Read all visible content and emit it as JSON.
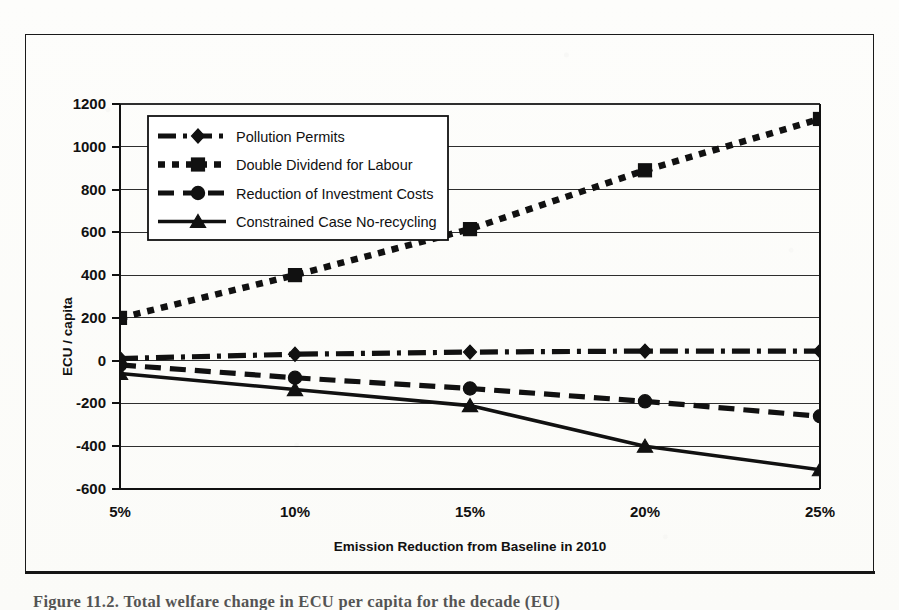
{
  "figure": {
    "caption": "Figure 11.2. Total welfare change in ECU per capita for the decade (EU)"
  },
  "chart_data": {
    "type": "line",
    "title": "",
    "xlabel": "Emission Reduction from Baseline in 2010",
    "ylabel": "ECU / capita",
    "categories": [
      "5%",
      "10%",
      "15%",
      "20%",
      "25%"
    ],
    "x": [
      5,
      10,
      15,
      20,
      25
    ],
    "ylim": [
      -600,
      1200
    ],
    "ytick_step": 200,
    "yticks": [
      1200,
      1000,
      800,
      600,
      400,
      200,
      0,
      -200,
      -400,
      -600
    ],
    "ytick_labels": [
      "1200",
      "1000",
      "800",
      "600",
      "400",
      "200",
      "0",
      "-200",
      "-400",
      "-600"
    ],
    "xtick_labels": [
      "5%",
      "10%",
      "15%",
      "20%",
      "25%"
    ],
    "grid": "horizontal",
    "legend_position": "upper-left-inside",
    "series": [
      {
        "name": "Pollution Permits",
        "marker": "diamond",
        "line": "dash-dot",
        "values": [
          10,
          30,
          40,
          45,
          45
        ]
      },
      {
        "name": "Double Dividend for Labour",
        "marker": "square",
        "line": "dotted",
        "values": [
          200,
          400,
          615,
          890,
          1130
        ]
      },
      {
        "name": "Reduction of Investment Costs",
        "marker": "circle",
        "line": "dashed",
        "values": [
          -20,
          -80,
          -130,
          -190,
          -260
        ]
      },
      {
        "name": "Constrained Case No-recycling",
        "marker": "triangle",
        "line": "solid",
        "values": [
          -60,
          -135,
          -210,
          -400,
          -510
        ]
      }
    ]
  },
  "colors": {
    "ink": "#111111",
    "grid": "#333333",
    "paper": "#fdfdfb"
  }
}
